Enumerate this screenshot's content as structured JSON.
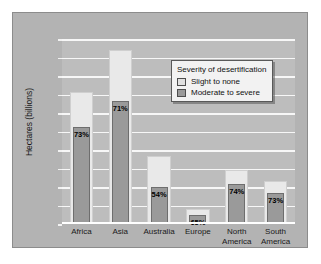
{
  "chart_data": {
    "type": "bar",
    "title": "",
    "xlabel": "",
    "ylabel": "Hectares (billions)",
    "ylim": [
      0,
      2.0
    ],
    "yticks": [
      "2.0",
      "1.8",
      "1.6",
      "1.4",
      "1.2",
      "1.0",
      "0.8",
      "0.6",
      "0.4",
      "0.2",
      "0"
    ],
    "ytick_values": [
      2.0,
      1.8,
      1.6,
      1.4,
      1.2,
      1.0,
      0.8,
      0.6,
      0.4,
      0.2,
      0
    ],
    "grid": true,
    "legend_position": "upper-right-inside",
    "categories": [
      "Africa",
      "Asia",
      "Australia",
      "Europe",
      "North America",
      "South America"
    ],
    "series": [
      {
        "name": "Slight to none",
        "values": [
          1.43,
          1.88,
          0.73,
          0.16,
          0.58,
          0.47
        ]
      },
      {
        "name": "Moderate to severe",
        "values": [
          1.05,
          1.33,
          0.4,
          0.1,
          0.43,
          0.34
        ]
      }
    ],
    "data_labels": [
      "73%",
      "71%",
      "54%",
      "65%",
      "74%",
      "73%"
    ],
    "colors": {
      "slight_to_none": "#e9e9e9",
      "moderate_to_severe": "#9a9a9a",
      "plot_background": "#bdbdbd",
      "figure_background": "#b3b3b3",
      "gridline": "#f7f7f7"
    }
  },
  "legend": {
    "title": "Severity of desertification",
    "items": [
      {
        "label": "Slight to none"
      },
      {
        "label": "Moderate to severe"
      }
    ]
  },
  "categories_display": [
    {
      "line1": "Africa",
      "line2": ""
    },
    {
      "line1": "Asia",
      "line2": ""
    },
    {
      "line1": "Australia",
      "line2": ""
    },
    {
      "line1": "Europe",
      "line2": ""
    },
    {
      "line1": "North",
      "line2": "America"
    },
    {
      "line1": "South",
      "line2": "America"
    }
  ]
}
